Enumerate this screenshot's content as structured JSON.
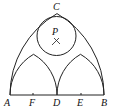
{
  "figure": {
    "type": "geometric-construction",
    "points": {
      "A": {
        "label": "A",
        "x": 10,
        "y": 95
      },
      "F": {
        "label": "F",
        "x": 33,
        "y": 95
      },
      "D": {
        "label": "D",
        "x": 57,
        "y": 95
      },
      "E": {
        "label": "E",
        "x": 81,
        "y": 95
      },
      "B": {
        "label": "B",
        "x": 104,
        "y": 95
      },
      "C": {
        "label": "C",
        "x": 57,
        "y": 14
      },
      "P": {
        "label": "P",
        "x": 56,
        "y": 36
      }
    },
    "circle": {
      "center": "P",
      "radius": 19
    },
    "line_color": "#222222",
    "background": "#ffffff"
  }
}
